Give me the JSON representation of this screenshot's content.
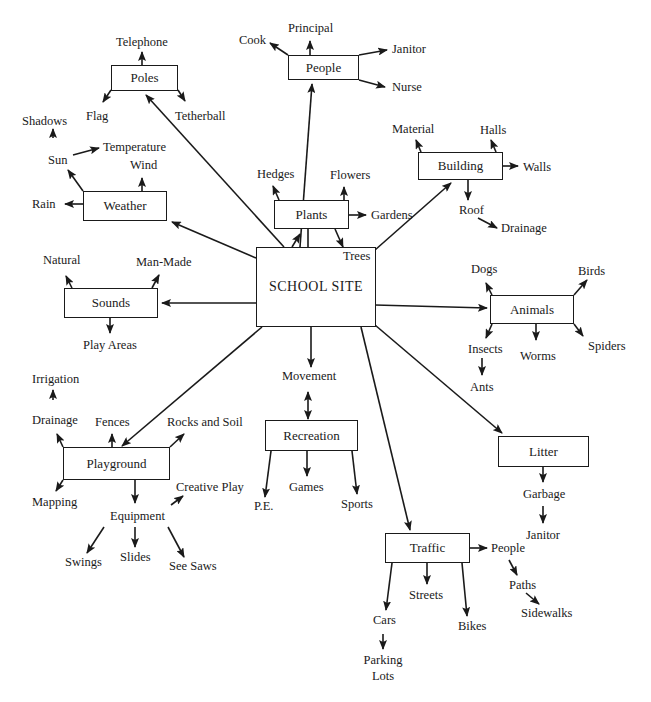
{
  "diagram": {
    "type": "concept-web",
    "center": {
      "label": "SCHOOL SITE"
    },
    "boxes": {
      "poles": "Poles",
      "people": "People",
      "weather": "Weather",
      "plants": "Plants",
      "building": "Building",
      "sounds": "Sounds",
      "animals": "Animals",
      "playground": "Playground",
      "recreation": "Recreation",
      "litter": "Litter",
      "traffic": "Traffic"
    },
    "labels": {
      "telephone": "Telephone",
      "flag": "Flag",
      "tetherball": "Tetherball",
      "principal": "Principal",
      "cook": "Cook",
      "janitor_people": "Janitor",
      "nurse": "Nurse",
      "shadows": "Shadows",
      "sun": "Sun",
      "temperature": "Temperature",
      "wind": "Wind",
      "rain": "Rain",
      "hedges": "Hedges",
      "flowers": "Flowers",
      "gardens": "Gardens",
      "trees": "Trees",
      "material": "Material",
      "halls": "Halls",
      "walls": "Walls",
      "roof": "Roof",
      "drainage_building": "Drainage",
      "natural": "Natural",
      "man_made": "Man-Made",
      "play_areas": "Play Areas",
      "dogs": "Dogs",
      "birds": "Birds",
      "insects": "Insects",
      "worms": "Worms",
      "spiders": "Spiders",
      "ants": "Ants",
      "irrigation": "Irrigation",
      "drainage_playground": "Drainage",
      "fences": "Fences",
      "rocks_and_soil": "Rocks and Soil",
      "mapping": "Mapping",
      "creative_play": "Creative Play",
      "equipment": "Equipment",
      "swings": "Swings",
      "slides": "Slides",
      "see_saws": "See Saws",
      "movement": "Movement",
      "pe": "P.E.",
      "games": "Games",
      "sports": "Sports",
      "garbage": "Garbage",
      "janitor_litter": "Janitor",
      "people_traffic": "People",
      "paths": "Paths",
      "sidewalks": "Sidewalks",
      "streets": "Streets",
      "cars": "Cars",
      "bikes": "Bikes",
      "parking_lots": "Parking Lots"
    },
    "hierarchy": [
      {
        "node": "Poles",
        "children": [
          "Telephone",
          "Flag",
          "Tetherball"
        ]
      },
      {
        "node": "People",
        "children": [
          "Principal",
          "Cook",
          "Janitor",
          "Nurse"
        ]
      },
      {
        "node": "Weather",
        "children": [
          {
            "node": "Sun",
            "children": [
              "Shadows",
              "Temperature"
            ]
          },
          "Wind",
          "Rain"
        ]
      },
      {
        "node": "Plants",
        "children": [
          "Hedges",
          "Flowers",
          "Gardens",
          "Trees"
        ]
      },
      {
        "node": "Building",
        "children": [
          "Material",
          "Halls",
          "Walls",
          {
            "node": "Roof",
            "children": [
              "Drainage"
            ]
          }
        ]
      },
      {
        "node": "Sounds",
        "children": [
          "Natural",
          "Man-Made",
          "Play Areas"
        ]
      },
      {
        "node": "Animals",
        "children": [
          "Dogs",
          "Birds",
          {
            "node": "Insects",
            "children": [
              "Ants"
            ]
          },
          "Worms",
          "Spiders"
        ]
      },
      {
        "node": "Playground",
        "children": [
          {
            "node": "Drainage",
            "children": [
              "Irrigation"
            ]
          },
          "Fences",
          "Rocks and Soil",
          "Mapping",
          {
            "node": "Equipment",
            "children": [
              "Creative Play",
              "Swings",
              "Slides",
              "See Saws"
            ]
          }
        ]
      },
      {
        "node": "Recreation",
        "children": [
          "Movement",
          "P.E.",
          "Games",
          "Sports"
        ]
      },
      {
        "node": "Litter",
        "children": [
          {
            "node": "Garbage",
            "children": [
              "Janitor"
            ]
          }
        ]
      },
      {
        "node": "Traffic",
        "children": [
          {
            "node": "People",
            "children": [
              {
                "node": "Paths",
                "children": [
                  "Sidewalks"
                ]
              }
            ]
          },
          "Streets",
          {
            "node": "Cars",
            "children": [
              "Parking Lots"
            ]
          },
          "Bikes"
        ]
      }
    ]
  }
}
